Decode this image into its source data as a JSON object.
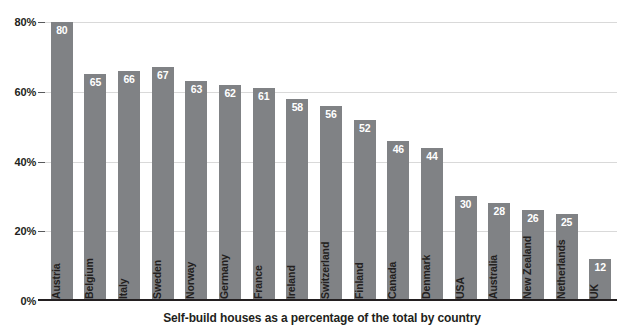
{
  "chart_data": {
    "type": "bar",
    "title": "",
    "caption": "Self-build houses as a percentage of the total by country",
    "xlabel": "",
    "ylabel": "",
    "ylim": [
      0,
      80
    ],
    "grid": true,
    "legend": "none",
    "orientation": "vertical",
    "value_label_position": "inside-top",
    "category_label_position": "inside-bar-rotated",
    "y_ticks": [
      0,
      20,
      40,
      60,
      80
    ],
    "y_tick_labels": [
      "0%",
      "20%",
      "40%",
      "60%",
      "80%"
    ],
    "bar_color": "#808285",
    "value_label_color": "#ffffff",
    "categories": [
      "Austria",
      "Belgium",
      "Italy",
      "Sweden",
      "Norway",
      "Germany",
      "France",
      "Ireland",
      "Switzerland",
      "Finland",
      "Canada",
      "Denmark",
      "USA",
      "Australia",
      "New Zealand",
      "Netherlands",
      "UK"
    ],
    "values": [
      80,
      65,
      66,
      67,
      63,
      62,
      61,
      58,
      56,
      52,
      46,
      44,
      30,
      28,
      26,
      25,
      12
    ]
  }
}
